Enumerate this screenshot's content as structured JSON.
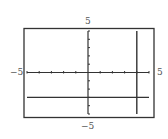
{
  "chart_data": {
    "type": "line",
    "title": "",
    "xlabel": "",
    "ylabel": "",
    "xlim": [
      -5,
      5
    ],
    "ylim": [
      -5,
      5
    ],
    "grid": false,
    "x_tick_step": 1,
    "y_tick_step": 1,
    "tick_labels": {
      "xmin": "−5",
      "xmax": "5",
      "ymin": "−5",
      "ymax": "5"
    },
    "series": [
      {
        "name": "horizontal line",
        "equation": "y = -3",
        "points": [
          [
            -5,
            -3
          ],
          [
            5,
            -3
          ]
        ]
      },
      {
        "name": "vertical line",
        "equation": "x = 4",
        "points": [
          [
            4,
            -5
          ],
          [
            4,
            5
          ]
        ]
      }
    ]
  },
  "colors": {
    "frame": "#333333",
    "axis": "#333333",
    "line": "#333333",
    "label": "#555555"
  }
}
